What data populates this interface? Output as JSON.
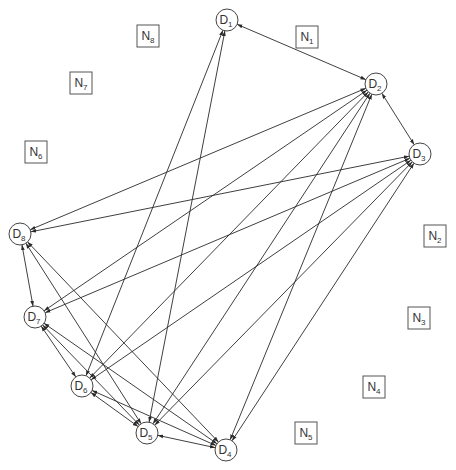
{
  "diagram": {
    "title": "",
    "colors": {
      "edge": "#2a2a2a",
      "node_stroke": "#444444",
      "text": "#333333",
      "background": "#ffffff"
    },
    "circle_nodes": [
      {
        "id": "D1",
        "base": "D",
        "sub": "1",
        "x": 227,
        "y": 20
      },
      {
        "id": "D2",
        "base": "D",
        "sub": "2",
        "x": 376,
        "y": 84
      },
      {
        "id": "D3",
        "base": "D",
        "sub": "3",
        "x": 420,
        "y": 154
      },
      {
        "id": "D4",
        "base": "D",
        "sub": "4",
        "x": 226,
        "y": 450
      },
      {
        "id": "D5",
        "base": "D",
        "sub": "5",
        "x": 147,
        "y": 433
      },
      {
        "id": "D6",
        "base": "D",
        "sub": "6",
        "x": 82,
        "y": 386
      },
      {
        "id": "D7",
        "base": "D",
        "sub": "7",
        "x": 35,
        "y": 317
      },
      {
        "id": "D8",
        "base": "D",
        "sub": "8",
        "x": 20,
        "y": 234
      }
    ],
    "box_nodes": [
      {
        "id": "N1",
        "base": "N",
        "sub": "1",
        "x": 307,
        "y": 37
      },
      {
        "id": "N2",
        "base": "N",
        "sub": "2",
        "x": 435,
        "y": 236
      },
      {
        "id": "N3",
        "base": "N",
        "sub": "3",
        "x": 419,
        "y": 318
      },
      {
        "id": "N4",
        "base": "N",
        "sub": "4",
        "x": 374,
        "y": 387
      },
      {
        "id": "N5",
        "base": "N",
        "sub": "5",
        "x": 306,
        "y": 433
      },
      {
        "id": "N6",
        "base": "N",
        "sub": "6",
        "x": 36,
        "y": 152
      },
      {
        "id": "N7",
        "base": "N",
        "sub": "7",
        "x": 81,
        "y": 83
      },
      {
        "id": "N8",
        "base": "N",
        "sub": "8",
        "x": 148,
        "y": 36
      }
    ],
    "edges": [
      [
        "D1",
        "D2"
      ],
      [
        "D1",
        "D5"
      ],
      [
        "D1",
        "D6"
      ],
      [
        "D2",
        "D3"
      ],
      [
        "D2",
        "D4"
      ],
      [
        "D2",
        "D5"
      ],
      [
        "D2",
        "D6"
      ],
      [
        "D2",
        "D7"
      ],
      [
        "D2",
        "D8"
      ],
      [
        "D3",
        "D4"
      ],
      [
        "D3",
        "D5"
      ],
      [
        "D3",
        "D6"
      ],
      [
        "D3",
        "D7"
      ],
      [
        "D3",
        "D8"
      ],
      [
        "D8",
        "D7"
      ],
      [
        "D8",
        "D5"
      ],
      [
        "D8",
        "D4"
      ],
      [
        "D7",
        "D6"
      ],
      [
        "D7",
        "D5"
      ],
      [
        "D7",
        "D4"
      ],
      [
        "D6",
        "D5"
      ],
      [
        "D6",
        "D4"
      ],
      [
        "D5",
        "D4"
      ]
    ],
    "directed": "both"
  }
}
